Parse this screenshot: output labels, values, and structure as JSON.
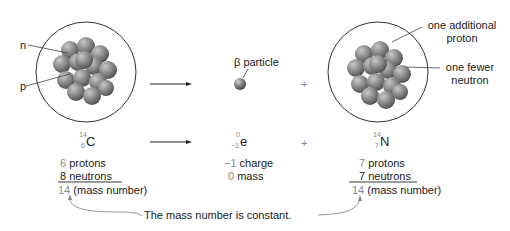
{
  "diagram": {
    "left_nucleus": {
      "labels": {
        "neutron": "n",
        "proton": "p"
      }
    },
    "beta": {
      "label": "β particle"
    },
    "right_nucleus": {
      "labels": {
        "additional_proton": [
          "one additional",
          "proton"
        ],
        "fewer_neutron": [
          "one fewer",
          "neutron"
        ]
      },
      "additional_proton_line1": "one additional",
      "additional_proton_line2": "proton",
      "fewer_neutron_line1": "one fewer",
      "fewer_neutron_line2": "neutron"
    },
    "operators": {
      "plus1": "+",
      "plus2": "+"
    },
    "reactant": {
      "symbol": "C",
      "mass": "14",
      "atomic": "6",
      "protons_num": "6",
      "protons_text": " protons",
      "neutrons_num": "8",
      "neutrons_text": " neutrons",
      "mass_num": "14",
      "mass_text": " (mass number)"
    },
    "particle": {
      "symbol": "e",
      "mass": "0",
      "atomic": "−1",
      "charge_num": "−1",
      "charge_text": " charge",
      "mass_num": "0",
      "mass_text": " mass"
    },
    "product": {
      "symbol": "N",
      "mass": "14",
      "atomic": "7",
      "protons_num": "7",
      "protons_text": " protons",
      "neutrons_num": "7",
      "neutrons_text": " neutrons",
      "mass_num": "14",
      "mass_text": " (mass number)"
    },
    "annotation": "The mass number is constant."
  },
  "colors": {
    "nucleon_dark": "#5a5a5a",
    "nucleon_light": "#a8a8a8",
    "outline": "#333333",
    "number_gray": "#8a8a8a"
  }
}
